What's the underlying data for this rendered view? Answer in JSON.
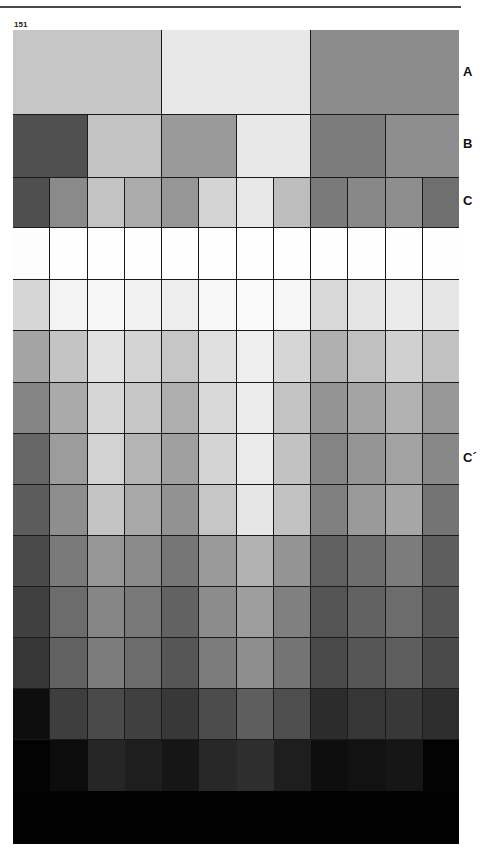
{
  "page": {
    "number": "151"
  },
  "labels": {
    "a": "A",
    "b": "B",
    "c": "C",
    "c_prime": "C´"
  },
  "chart_data": {
    "type": "heatmap",
    "title": "",
    "rows": [
      {
        "label": "A",
        "top": 0,
        "height": 85,
        "cells": [
          "#c6c6c6",
          "#e8e8e8",
          "#8c8c8c"
        ]
      },
      {
        "label": "B",
        "top": 85,
        "height": 63,
        "cells": [
          "#505050",
          "#c4c4c4",
          "#9a9a9a",
          "#e8e8e8",
          "#7c7c7c",
          "#8e8e8e"
        ]
      },
      {
        "label": "C",
        "top": 148,
        "height": 50,
        "cells": [
          "#4f4f4f",
          "#8a8a8a",
          "#c4c4c4",
          "#ababab",
          "#969696",
          "#d4d4d4",
          "#e8e8e8",
          "#bdbdbd",
          "#7a7a7a",
          "#888888",
          "#8e8e8e",
          "#6f6f6f"
        ]
      },
      {
        "label": "C´-1",
        "top": 198,
        "height": 52,
        "cells": [
          "#fdfdfd",
          "#fefefe",
          "#fefefe",
          "#fefefe",
          "#fefefe",
          "#fefefe",
          "#fefefe",
          "#fefefe",
          "#fefefe",
          "#fefefe",
          "#fefefe",
          "#fefefe"
        ]
      },
      {
        "label": "C´-2",
        "top": 250,
        "height": 51,
        "cells": [
          "#d6d6d6",
          "#f3f3f3",
          "#f7f7f7",
          "#f2f2f2",
          "#eeeeee",
          "#f8f8f8",
          "#fafafa",
          "#f6f6f6",
          "#d8d8d8",
          "#e4e4e4",
          "#ebebeb",
          "#e6e6e6"
        ]
      },
      {
        "label": "C´-3",
        "top": 301,
        "height": 52,
        "cells": [
          "#a4a4a4",
          "#c4c4c4",
          "#e2e2e2",
          "#d4d4d4",
          "#c6c6c6",
          "#e0e0e0",
          "#efefef",
          "#d6d6d6",
          "#b0b0b0",
          "#c0c0c0",
          "#d0d0d0",
          "#c2c2c2"
        ]
      },
      {
        "label": "C´-4",
        "top": 353,
        "height": 51,
        "cells": [
          "#858585",
          "#aaaaaa",
          "#d6d6d6",
          "#c6c6c6",
          "#aeaeae",
          "#d8d8d8",
          "#ececec",
          "#c4c4c4",
          "#949494",
          "#a4a4a4",
          "#b2b2b2",
          "#989898"
        ]
      },
      {
        "label": "C´-5",
        "top": 404,
        "height": 51,
        "cells": [
          "#666666",
          "#9c9c9c",
          "#d2d2d2",
          "#b4b4b4",
          "#a0a0a0",
          "#d4d4d4",
          "#eaeaea",
          "#c2c2c2",
          "#848484",
          "#959595",
          "#a2a2a2",
          "#888888"
        ]
      },
      {
        "label": "C´-6",
        "top": 455,
        "height": 51,
        "cells": [
          "#5c5c5c",
          "#8e8e8e",
          "#c4c4c4",
          "#a8a8a8",
          "#929292",
          "#c6c6c6",
          "#e6e6e6",
          "#c2c2c2",
          "#808080",
          "#9a9a9a",
          "#a6a6a6",
          "#747474"
        ]
      },
      {
        "label": "C´-7",
        "top": 506,
        "height": 51,
        "cells": [
          "#4a4a4a",
          "#7a7a7a",
          "#969696",
          "#8a8a8a",
          "#767676",
          "#9a9a9a",
          "#b2b2b2",
          "#949494",
          "#606060",
          "#6e6e6e",
          "#7c7c7c",
          "#5e5e5e"
        ]
      },
      {
        "label": "C´-8",
        "top": 557,
        "height": 51,
        "cells": [
          "#404040",
          "#6c6c6c",
          "#868686",
          "#787878",
          "#626262",
          "#8c8c8c",
          "#9e9e9e",
          "#808080",
          "#545454",
          "#626262",
          "#6c6c6c",
          "#555555"
        ]
      },
      {
        "label": "C´-9",
        "top": 608,
        "height": 51,
        "cells": [
          "#363636",
          "#626262",
          "#7c7c7c",
          "#6c6c6c",
          "#565656",
          "#7c7c7c",
          "#8e8e8e",
          "#747474",
          "#4a4a4a",
          "#565656",
          "#5e5e5e",
          "#4a4a4a"
        ]
      },
      {
        "label": "C´-10",
        "top": 659,
        "height": 51,
        "cells": [
          "#0e0e0e",
          "#3e3e3e",
          "#4a4a4a",
          "#404040",
          "#383838",
          "#4c4c4c",
          "#5e5e5e",
          "#4e4e4e",
          "#2c2c2c",
          "#363636",
          "#383838",
          "#2e2e2e"
        ]
      },
      {
        "label": "C´-11",
        "top": 710,
        "height": 51,
        "cells": [
          "#030303",
          "#0c0c0c",
          "#262626",
          "#1e1e1e",
          "#161616",
          "#282828",
          "#2e2e2e",
          "#1e1e1e",
          "#0e0e0e",
          "#121212",
          "#161616",
          "#030303"
        ]
      },
      {
        "label": "C´-12",
        "top": 761,
        "height": 53,
        "cells": [
          "#020202",
          "#020202",
          "#020202",
          "#020202",
          "#020202",
          "#020202",
          "#020202",
          "#020202",
          "#020202",
          "#020202",
          "#020202",
          "#020202"
        ]
      }
    ],
    "row_labels": [
      "A",
      "B",
      "C",
      "C´"
    ],
    "columns_fine": 12
  }
}
